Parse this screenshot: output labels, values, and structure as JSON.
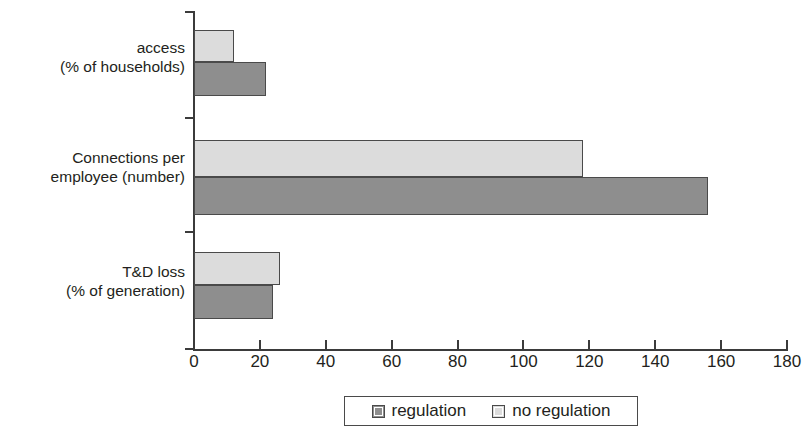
{
  "chart_data": {
    "type": "bar",
    "orientation": "horizontal",
    "title": "",
    "xlabel": "",
    "ylabel": "",
    "xlim": [
      0,
      180
    ],
    "xticks": [
      0,
      20,
      40,
      60,
      80,
      100,
      120,
      140,
      160,
      180
    ],
    "xtick_labels": [
      "0",
      "20",
      "40",
      "60",
      "80",
      "100",
      "120",
      "140",
      "160",
      "180"
    ],
    "grid": false,
    "legend_position": "bottom",
    "categories": [
      "access (% of households)",
      "Connections per employee (number)",
      "T&D loss (% of generation)"
    ],
    "category_lines": [
      {
        "line1": "access",
        "line2": "(% of households)"
      },
      {
        "line1": "Connections per",
        "line2": "employee (number)"
      },
      {
        "line1": "T&D loss",
        "line2": "(% of generation)"
      }
    ],
    "series": [
      {
        "name": "regulation",
        "color": "#8e8e8e",
        "values": [
          22,
          156,
          24
        ]
      },
      {
        "name": "no regulation",
        "color": "#dcdcdc",
        "values": [
          12,
          118,
          26
        ]
      }
    ]
  },
  "legend": {
    "items": [
      {
        "label": "regulation",
        "color": "#8e8e8e"
      },
      {
        "label": "no regulation",
        "color": "#dcdcdc"
      }
    ]
  },
  "colors": {
    "axis": "#3b3b3b",
    "bar_border": "#4a4a4a",
    "text": "#231f20",
    "background": "#ffffff"
  }
}
